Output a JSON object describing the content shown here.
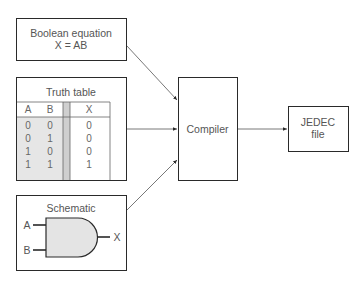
{
  "boolean_box": {
    "title": "Boolean equation",
    "equation": "X = AB"
  },
  "truth_table": {
    "title": "Truth table",
    "headers": [
      "A",
      "B",
      "X"
    ],
    "rows": [
      [
        "0",
        "0",
        "0"
      ],
      [
        "0",
        "1",
        "0"
      ],
      [
        "1",
        "0",
        "0"
      ],
      [
        "1",
        "1",
        "1"
      ]
    ]
  },
  "schematic": {
    "title": "Schematic",
    "input_a": "A",
    "input_b": "B",
    "output": "X"
  },
  "compiler": {
    "label": "Compiler"
  },
  "jedec": {
    "line1": "JEDEC",
    "line2": "file"
  },
  "colors": {
    "stroke": "#2a2a2a",
    "shade": "#e4e4e4",
    "separator": "#cfcfcf",
    "text": "#555555"
  }
}
